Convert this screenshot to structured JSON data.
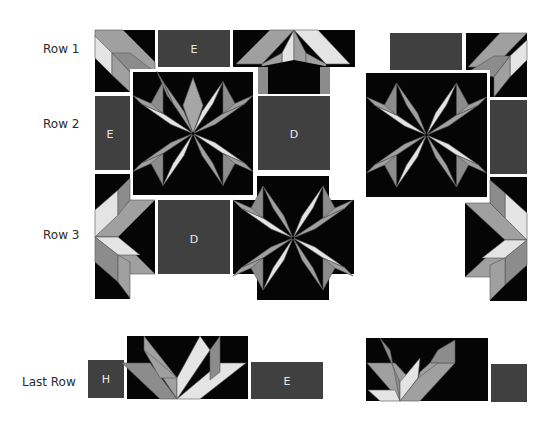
{
  "diagram": {
    "row_labels": [
      "Row 1",
      "Row 2",
      "Row 3",
      "Last Row"
    ],
    "piece_labels": {
      "row1_e": "E",
      "row2_e": "E",
      "row2_d": "D",
      "row3_d": "D",
      "last_h": "H",
      "last_e": "E"
    },
    "colors": {
      "background": "#ffffff",
      "black": "#050505",
      "dark_fill": "#404040",
      "medium_gray": "#a0a0a0",
      "mid_dark_gray": "#8c8c8c",
      "light_gray": "#e4e4e4",
      "label_text": "#e8e8e8"
    }
  }
}
